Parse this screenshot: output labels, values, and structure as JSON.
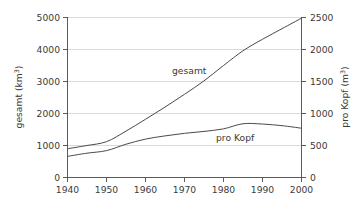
{
  "chart_data": {
    "type": "line",
    "title": "",
    "xlabel": "",
    "ylabel": "gesamt (km3)",
    "ylabel_text": "gesamt (km",
    "ylabel_sup": "3",
    "ylabel_tail": ")",
    "y2label_text": "pro Kopf (m",
    "y2label_sup": "3",
    "y2label_tail": ")",
    "grid": true,
    "legend_position": "inline-annotation",
    "x": [
      1940,
      1945,
      1950,
      1955,
      1960,
      1965,
      1970,
      1975,
      1980,
      1985,
      1990,
      1995,
      2000
    ],
    "xlim": [
      1940,
      2000
    ],
    "xticks": [
      1940,
      1950,
      1960,
      1970,
      1980,
      1990,
      2000
    ],
    "xtick_labels": [
      "1940",
      "1950",
      "1960",
      "1970",
      "1980",
      "1990",
      "2000"
    ],
    "ylim": [
      0,
      5000
    ],
    "yticks": [
      0,
      1000,
      2000,
      3000,
      4000,
      5000
    ],
    "ytick_labels": [
      "0",
      "1000",
      "2000",
      "3000",
      "4000",
      "5000"
    ],
    "y2lim": [
      0,
      2500
    ],
    "y2ticks": [
      0,
      500,
      1000,
      1500,
      2000,
      2500
    ],
    "y2tick_labels": [
      "0",
      "500",
      "1000",
      "1500",
      "2000",
      "2500"
    ],
    "series": [
      {
        "name": "gesamt",
        "axis": "left",
        "unit": "km3",
        "label": "gesamt",
        "values": [
          900,
          1000,
          1120,
          1450,
          1820,
          2200,
          2600,
          3020,
          3500,
          3960,
          4320,
          4650,
          4980
        ]
      },
      {
        "name": "pro Kopf",
        "axis": "right",
        "unit": "m3",
        "label": "pro Kopf",
        "values": [
          330,
          380,
          420,
          520,
          600,
          650,
          690,
          720,
          760,
          840,
          835,
          810,
          770
        ]
      }
    ],
    "annotations": [
      {
        "text": "gesamt",
        "x": 1968,
        "y": 3250,
        "axis": "left"
      },
      {
        "text": "pro Kopf",
        "x": 1985,
        "y": 1280,
        "axis": "left"
      }
    ]
  }
}
